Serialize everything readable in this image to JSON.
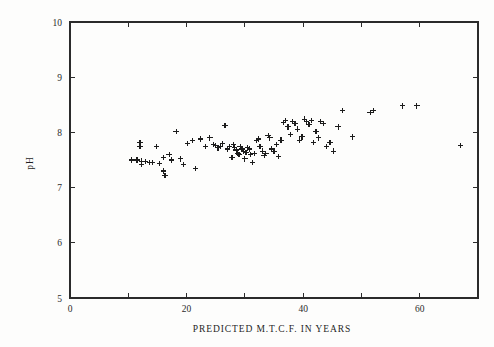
{
  "chart_data": {
    "type": "scatter",
    "title": "",
    "subtitle": "",
    "xlabel": "PREDICTED M.T.C.F. IN YEARS",
    "ylabel": "pH",
    "xlim": [
      0,
      70
    ],
    "ylim": [
      5,
      10
    ],
    "xticks": [
      0,
      10,
      20,
      30,
      40,
      50,
      60,
      70
    ],
    "xtick_labels": [
      "0",
      "",
      "20",
      "",
      "40",
      "",
      "60",
      ""
    ],
    "yticks": [
      5,
      6,
      7,
      8,
      9,
      10
    ],
    "ytick_labels": [
      "5",
      "6",
      "7",
      "8",
      "9",
      "10"
    ],
    "grid": false,
    "legend": null,
    "marker": "plus",
    "marker_color": "#1c1c1c",
    "series": [
      {
        "name": "samples",
        "x": [
          10.5,
          11.5,
          12.0,
          12.0,
          12.3,
          12.3,
          13.0,
          13.6,
          14.2,
          14.8,
          15.4,
          16.0,
          16.0,
          16.3,
          17.0,
          17.4,
          18.2,
          19.0,
          19.5,
          20.2,
          21.0,
          21.5,
          22.4,
          23.2,
          24.0,
          24.6,
          25.0,
          25.4,
          25.8,
          26.2,
          26.6,
          27.0,
          27.4,
          27.8,
          28.0,
          28.2,
          28.5,
          28.8,
          29.0,
          29.2,
          29.5,
          29.8,
          30.0,
          30.2,
          30.5,
          30.8,
          31.0,
          31.3,
          31.6,
          32.0,
          32.3,
          32.6,
          33.0,
          33.3,
          33.6,
          34.0,
          34.3,
          34.6,
          35.0,
          35.4,
          35.8,
          36.2,
          36.6,
          37.0,
          37.4,
          37.8,
          38.2,
          38.6,
          39.0,
          39.4,
          39.8,
          40.2,
          40.6,
          41.0,
          41.4,
          41.8,
          42.2,
          42.6,
          43.0,
          43.5,
          44.0,
          44.6,
          45.2,
          46.0,
          46.8,
          48.5,
          51.5,
          52.0,
          57.0,
          59.5,
          67.0
        ],
        "y": [
          7.5,
          7.5,
          7.82,
          7.75,
          7.48,
          7.42,
          7.47,
          7.46,
          7.45,
          7.75,
          7.44,
          7.3,
          7.55,
          7.22,
          7.6,
          7.5,
          8.02,
          7.52,
          7.42,
          7.8,
          7.85,
          7.35,
          7.88,
          7.74,
          7.9,
          7.78,
          7.76,
          7.72,
          7.74,
          7.8,
          8.12,
          7.7,
          7.74,
          7.55,
          7.78,
          7.72,
          7.68,
          7.62,
          7.6,
          7.74,
          7.7,
          7.66,
          7.52,
          7.64,
          7.72,
          7.7,
          7.6,
          7.46,
          7.62,
          7.85,
          7.88,
          7.74,
          7.66,
          7.58,
          7.62,
          7.94,
          7.9,
          7.7,
          7.66,
          7.78,
          7.56,
          7.86,
          8.18,
          8.22,
          8.1,
          7.96,
          8.2,
          8.16,
          8.06,
          7.86,
          7.92,
          8.24,
          8.2,
          8.14,
          8.22,
          7.82,
          8.02,
          7.9,
          8.2,
          8.16,
          7.74,
          7.82,
          7.66,
          8.1,
          8.4,
          7.92,
          8.36,
          8.4,
          8.48,
          8.48,
          7.76
        ]
      }
    ]
  },
  "axes": {
    "y_label": "pH",
    "x_label": "PREDICTED M.T.C.F. IN YEARS"
  }
}
